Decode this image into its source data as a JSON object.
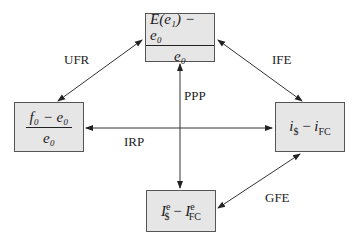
{
  "nodes": {
    "top": {
      "numerator": "E(e₁) − e₀",
      "denominator": "e₀"
    },
    "left": {
      "numerator": "f₀ − e₀",
      "denominator": "e₀"
    },
    "right": {
      "expr_a": "i",
      "expr_a_sub": "$",
      "minus": " − ",
      "expr_b": "i",
      "expr_b_sub": "FC"
    },
    "bottom": {
      "expr_a": "I",
      "expr_a_sub": "$",
      "expr_a_sup": "e",
      "minus": " − ",
      "expr_b": "I",
      "expr_b_sub": "FC",
      "expr_b_sup": "e"
    }
  },
  "edges": {
    "ufr": "UFR",
    "ife": "IFE",
    "ppp": "PPP",
    "irp": "IRP",
    "gfe": "GFE"
  },
  "colors": {
    "box_fill": "#e6e6e6",
    "box_border": "#555555",
    "line": "#333333"
  }
}
